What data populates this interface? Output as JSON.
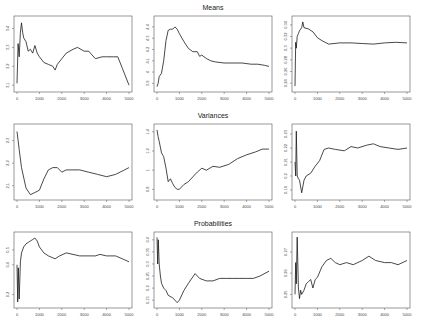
{
  "figure": {
    "row_titles": [
      "Means",
      "Variances",
      "Probabilities"
    ]
  },
  "chart_data": [
    {
      "type": "line",
      "row": 0,
      "col": 0,
      "title": "",
      "xlabel": "",
      "ylabel": "",
      "xlim": [
        0,
        5000
      ],
      "ylim": [
        3.08,
        3.45
      ],
      "xticks": [
        0,
        1000,
        2000,
        3000,
        4000,
        5000
      ],
      "yticks": [
        3.1,
        3.2,
        3.3,
        3.4
      ],
      "x": [
        0,
        50,
        100,
        150,
        200,
        250,
        300,
        400,
        500,
        600,
        700,
        800,
        900,
        1000,
        1200,
        1400,
        1600,
        1700,
        1800,
        2000,
        2200,
        2500,
        2700,
        3000,
        3200,
        3500,
        3800,
        4000,
        4300,
        4500,
        4700,
        5000
      ],
      "values": [
        3.11,
        3.32,
        3.25,
        3.38,
        3.43,
        3.38,
        3.35,
        3.33,
        3.28,
        3.29,
        3.27,
        3.31,
        3.27,
        3.25,
        3.22,
        3.21,
        3.2,
        3.18,
        3.21,
        3.24,
        3.27,
        3.29,
        3.3,
        3.28,
        3.28,
        3.24,
        3.25,
        3.25,
        3.25,
        3.25,
        3.19,
        3.1
      ]
    },
    {
      "type": "line",
      "row": 0,
      "col": 1,
      "title": "Means",
      "xlabel": "",
      "ylabel": "",
      "xlim": [
        0,
        5000
      ],
      "ylim": [
        3.85,
        4.47
      ],
      "xticks": [
        0,
        1000,
        2000,
        3000,
        4000,
        5000
      ],
      "yticks": [
        3.9,
        4.0,
        4.1,
        4.2,
        4.3,
        4.4
      ],
      "x": [
        0,
        50,
        100,
        200,
        300,
        400,
        500,
        600,
        700,
        800,
        900,
        1000,
        1200,
        1400,
        1600,
        1800,
        1900,
        2000,
        2200,
        2400,
        2600,
        3000,
        3400,
        3800,
        4200,
        4500,
        4800,
        5000
      ],
      "values": [
        3.87,
        3.9,
        3.96,
        3.99,
        4.1,
        4.28,
        4.37,
        4.38,
        4.38,
        4.4,
        4.38,
        4.34,
        4.27,
        4.21,
        4.18,
        4.18,
        4.14,
        4.15,
        4.12,
        4.1,
        4.09,
        4.08,
        4.08,
        4.08,
        4.07,
        4.07,
        4.06,
        4.05
      ]
    },
    {
      "type": "line",
      "row": 0,
      "col": 2,
      "title": "",
      "xlabel": "",
      "ylabel": "",
      "xlim": [
        0,
        5000
      ],
      "ylim": [
        0.23,
        0.35
      ],
      "xticks": [
        0,
        1000,
        2000,
        3000,
        4000,
        5000
      ],
      "yticks": [
        0.24,
        0.26,
        0.28,
        0.3,
        0.32,
        0.34
      ],
      "x": [
        0,
        30,
        60,
        100,
        150,
        200,
        300,
        350,
        400,
        600,
        800,
        1000,
        1200,
        1500,
        2000,
        2500,
        3000,
        3500,
        4000,
        4500,
        5000
      ],
      "values": [
        0.235,
        0.31,
        0.3,
        0.32,
        0.325,
        0.33,
        0.335,
        0.345,
        0.335,
        0.333,
        0.328,
        0.318,
        0.313,
        0.307,
        0.309,
        0.309,
        0.308,
        0.307,
        0.309,
        0.31,
        0.309
      ]
    },
    {
      "type": "line",
      "row": 1,
      "col": 0,
      "title": "",
      "xlabel": "",
      "ylabel": "",
      "xlim": [
        0,
        5000
      ],
      "ylim": [
        2.05,
        2.36
      ],
      "xticks": [
        0,
        1000,
        2000,
        3000,
        4000,
        5000
      ],
      "yticks": [
        2.1,
        2.2,
        2.3
      ],
      "x": [
        0,
        50,
        100,
        200,
        400,
        600,
        800,
        1000,
        1200,
        1400,
        1600,
        1800,
        2000,
        2200,
        2400,
        2800,
        3200,
        3600,
        4000,
        4400,
        4800,
        5000
      ],
      "values": [
        2.34,
        2.3,
        2.26,
        2.18,
        2.09,
        2.06,
        2.07,
        2.08,
        2.13,
        2.17,
        2.18,
        2.18,
        2.16,
        2.17,
        2.17,
        2.17,
        2.16,
        2.15,
        2.14,
        2.15,
        2.17,
        2.18
      ]
    },
    {
      "type": "line",
      "row": 1,
      "col": 1,
      "title": "Variances",
      "xlabel": "",
      "ylabel": "",
      "xlim": [
        0,
        5000
      ],
      "ylim": [
        0.72,
        1.45
      ],
      "xticks": [
        0,
        1000,
        2000,
        3000,
        4000,
        5000
      ],
      "yticks": [
        0.8,
        1.0,
        1.2,
        1.4
      ],
      "x": [
        0,
        50,
        100,
        200,
        300,
        400,
        500,
        600,
        700,
        800,
        900,
        1000,
        1200,
        1400,
        1600,
        1800,
        2000,
        2200,
        2500,
        2800,
        3200,
        3600,
        4000,
        4400,
        4700,
        5000
      ],
      "values": [
        1.42,
        1.35,
        1.3,
        1.18,
        1.14,
        1.02,
        0.88,
        0.91,
        0.86,
        0.82,
        0.8,
        0.8,
        0.85,
        0.88,
        0.93,
        0.98,
        1.02,
        1.0,
        1.04,
        1.03,
        1.06,
        1.12,
        1.16,
        1.19,
        1.22,
        1.22
      ]
    },
    {
      "type": "line",
      "row": 1,
      "col": 2,
      "title": "",
      "xlabel": "",
      "ylabel": "",
      "xlim": [
        0,
        5000
      ],
      "ylim": [
        0.185,
        0.235
      ],
      "xticks": [
        0,
        1000,
        2000,
        3000,
        4000,
        5000
      ],
      "yticks": [
        0.19,
        0.2,
        0.21,
        0.22,
        0.23
      ],
      "x": [
        0,
        30,
        60,
        100,
        150,
        200,
        300,
        400,
        500,
        700,
        900,
        1100,
        1300,
        1500,
        1800,
        2200,
        2500,
        2800,
        3200,
        3500,
        3800,
        4200,
        4600,
        5000
      ],
      "values": [
        0.21,
        0.2,
        0.232,
        0.2,
        0.198,
        0.197,
        0.188,
        0.197,
        0.2,
        0.202,
        0.207,
        0.211,
        0.219,
        0.22,
        0.219,
        0.218,
        0.221,
        0.22,
        0.222,
        0.223,
        0.221,
        0.22,
        0.219,
        0.22
      ]
    },
    {
      "type": "line",
      "row": 2,
      "col": 0,
      "title": "",
      "xlabel": "",
      "ylabel": "",
      "xlim": [
        0,
        5000
      ],
      "ylim": [
        0.13,
        0.6
      ],
      "xticks": [
        0,
        1000,
        2000,
        3000,
        4000,
        5000
      ],
      "yticks": [
        0.2,
        0.4,
        0.5
      ],
      "x": [
        0,
        30,
        60,
        100,
        150,
        200,
        300,
        400,
        500,
        600,
        700,
        800,
        900,
        1000,
        1200,
        1400,
        1700,
        1900,
        2200,
        2500,
        2800,
        3100,
        3500,
        3700,
        4000,
        4400,
        4700,
        5000
      ],
      "values": [
        0.4,
        0.15,
        0.38,
        0.17,
        0.42,
        0.48,
        0.52,
        0.54,
        0.55,
        0.56,
        0.57,
        0.58,
        0.56,
        0.52,
        0.48,
        0.46,
        0.44,
        0.46,
        0.48,
        0.47,
        0.46,
        0.46,
        0.46,
        0.47,
        0.46,
        0.46,
        0.44,
        0.42
      ]
    },
    {
      "type": "line",
      "row": 2,
      "col": 1,
      "title": "Probabilities",
      "xlabel": "",
      "ylabel": "",
      "xlim": [
        0,
        5000
      ],
      "ylim": [
        0.13,
        0.42
      ],
      "xticks": [
        0,
        1000,
        2000,
        3000,
        4000,
        5000
      ],
      "yticks": [
        0.15,
        0.2,
        0.25,
        0.3,
        0.35,
        0.4
      ],
      "x": [
        0,
        30,
        60,
        100,
        150,
        200,
        300,
        400,
        500,
        700,
        900,
        1000,
        1200,
        1400,
        1700,
        1900,
        2200,
        2500,
        2800,
        3100,
        3400,
        3700,
        4000,
        4300,
        4600,
        5000
      ],
      "values": [
        0.41,
        0.3,
        0.4,
        0.3,
        0.25,
        0.22,
        0.2,
        0.19,
        0.17,
        0.16,
        0.14,
        0.15,
        0.19,
        0.22,
        0.26,
        0.24,
        0.23,
        0.23,
        0.24,
        0.24,
        0.24,
        0.24,
        0.24,
        0.24,
        0.25,
        0.27
      ]
    },
    {
      "type": "line",
      "row": 2,
      "col": 2,
      "title": "",
      "xlabel": "",
      "ylabel": "",
      "xlim": [
        0,
        5000
      ],
      "ylim": [
        0.245,
        0.278
      ],
      "xticks": [
        0,
        1000,
        2000,
        3000,
        4000,
        5000
      ],
      "yticks": [
        0.25,
        0.26,
        0.27
      ],
      "x": [
        0,
        30,
        60,
        100,
        150,
        200,
        250,
        300,
        400,
        500,
        600,
        700,
        800,
        900,
        1000,
        1200,
        1400,
        1600,
        1800,
        2000,
        2300,
        2600,
        3000,
        3300,
        3600,
        4000,
        4300,
        4600,
        5000
      ],
      "values": [
        0.25,
        0.265,
        0.255,
        0.277,
        0.253,
        0.248,
        0.252,
        0.25,
        0.252,
        0.255,
        0.256,
        0.257,
        0.253,
        0.257,
        0.258,
        0.263,
        0.266,
        0.267,
        0.265,
        0.264,
        0.265,
        0.264,
        0.266,
        0.268,
        0.266,
        0.265,
        0.265,
        0.264,
        0.266
      ]
    }
  ]
}
